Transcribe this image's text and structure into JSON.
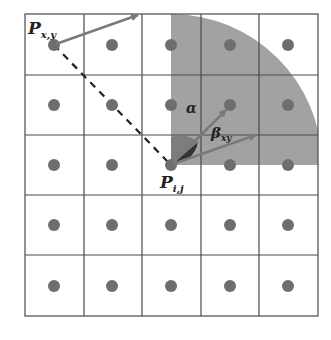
{
  "diagram": {
    "title": "",
    "grid": {
      "rows": 5,
      "cols": 5
    },
    "colors": {
      "grid_line": "#4a4a4a",
      "dot": "#6e6e6e",
      "sector": "#9a9a9a",
      "arrow": "#7a7a7a",
      "dash": "#222222",
      "angle_wedge": "#333333"
    },
    "labels": {
      "p_xy_main": "P",
      "p_xy_sub": "x,y",
      "p_ij_main": "P",
      "p_ij_sub": "i,j",
      "alpha": "α",
      "beta_main": "β",
      "beta_sub": "xy"
    }
  }
}
